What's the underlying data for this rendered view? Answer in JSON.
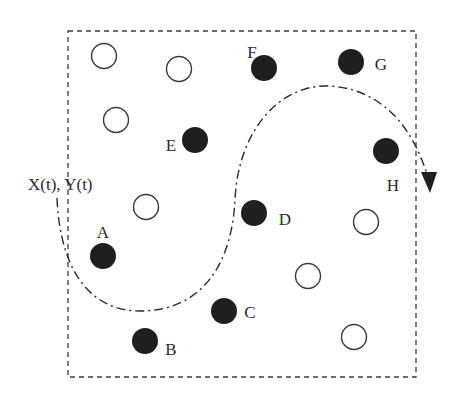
{
  "diagram": {
    "colors": {
      "stroke": "#3a3a3a",
      "filled": "#1f1f1f",
      "open_fill": "#ffffff",
      "text": "#2a2a2a"
    },
    "region": {
      "x": 68,
      "y": 31,
      "width": 348,
      "height": 346,
      "style": "dashed"
    },
    "trajectory_label": "X(t), Y(t)",
    "trajectory_path": "M57,198 C60,270 90,312 142,311 C205,310 232,260 235,200 C238,130 280,86 325,86 C370,86 410,115 428,178",
    "open_nodes": [
      {
        "cx": 104,
        "cy": 56
      },
      {
        "cx": 179,
        "cy": 69
      },
      {
        "cx": 116,
        "cy": 120
      },
      {
        "cx": 146,
        "cy": 207
      },
      {
        "cx": 366,
        "cy": 222
      },
      {
        "cx": 308,
        "cy": 276
      },
      {
        "cx": 354,
        "cy": 337
      }
    ],
    "labeled_nodes": [
      {
        "label": "F",
        "cx": 264,
        "cy": 68,
        "lx": 252,
        "ly": 58
      },
      {
        "label": "G",
        "cx": 351,
        "cy": 62,
        "lx": 381,
        "ly": 70
      },
      {
        "label": "E",
        "cx": 195,
        "cy": 140,
        "lx": 171,
        "ly": 151
      },
      {
        "label": "H",
        "cx": 386,
        "cy": 151,
        "lx": 393,
        "ly": 191
      },
      {
        "label": "D",
        "cx": 254,
        "cy": 213,
        "lx": 285,
        "ly": 225
      },
      {
        "label": "A",
        "cx": 103,
        "cy": 256,
        "lx": 103,
        "ly": 238
      },
      {
        "label": "C",
        "cx": 224,
        "cy": 311,
        "lx": 250,
        "ly": 318
      },
      {
        "label": "B",
        "cx": 145,
        "cy": 341,
        "lx": 171,
        "ly": 355
      }
    ]
  }
}
